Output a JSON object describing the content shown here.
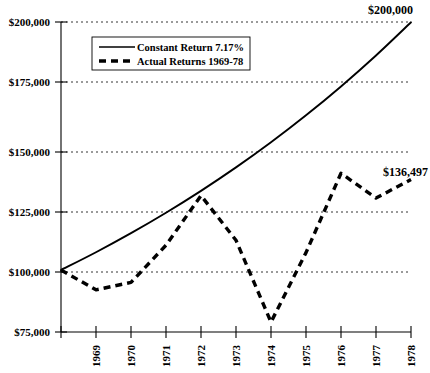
{
  "chart_data": {
    "type": "line",
    "title": "",
    "xlabel": "",
    "ylabel": "",
    "x": [
      1968,
      1969,
      1970,
      1971,
      1972,
      1973,
      1974,
      1975,
      1976,
      1977,
      1978
    ],
    "xlim": [
      1968,
      1978
    ],
    "ylim": [
      75000,
      200000
    ],
    "yticks": [
      75000,
      100000,
      125000,
      150000,
      175000,
      200000
    ],
    "ytick_labels": [
      "$75,000",
      "$100,000",
      "$125,000",
      "$150,000",
      "$175,000",
      "$200,000"
    ],
    "xtick_labels": [
      "1969",
      "1970",
      "1971",
      "1972",
      "1973",
      "1974",
      "1975",
      "1976",
      "1977",
      "1978"
    ],
    "grid": true,
    "legend_position": "upper left",
    "series": [
      {
        "name": "Constant Return 7.17%",
        "style": "solid",
        "values": [
          100000,
          107170,
          114854,
          123089,
          131914,
          141372,
          151510,
          162378,
          174028,
          186506,
          199878
        ]
      },
      {
        "name": "Actual Returns 1969-78",
        "style": "dashed",
        "values": [
          100000,
          92000,
          95000,
          110000,
          130000,
          112000,
          79000,
          107000,
          139000,
          129000,
          136497
        ]
      }
    ],
    "annotations": [
      {
        "text": "$200,000",
        "x": 1978,
        "y": 200000
      },
      {
        "text": "$136,497",
        "x": 1978,
        "y": 136497
      }
    ]
  }
}
